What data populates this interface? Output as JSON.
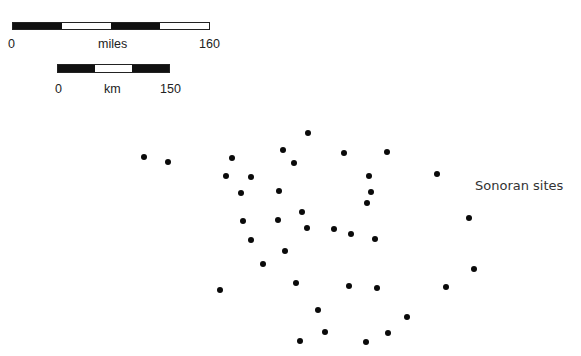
{
  "scale_bars": {
    "miles": {
      "start": "0",
      "unit": "miles",
      "end": "160",
      "segments": [
        "black",
        "white",
        "black",
        "white"
      ]
    },
    "km": {
      "start": "0",
      "unit": "km",
      "end": "150",
      "segments": [
        "black",
        "white",
        "black"
      ]
    }
  },
  "legend": {
    "label": "Sonoran sites",
    "marker_color": "#0a0a0a"
  },
  "sites": [
    {
      "x": 144,
      "y": 157
    },
    {
      "x": 168,
      "y": 162
    },
    {
      "x": 232,
      "y": 158
    },
    {
      "x": 308,
      "y": 133
    },
    {
      "x": 283,
      "y": 150
    },
    {
      "x": 294,
      "y": 163
    },
    {
      "x": 226,
      "y": 176
    },
    {
      "x": 251,
      "y": 177
    },
    {
      "x": 241,
      "y": 193
    },
    {
      "x": 279,
      "y": 191
    },
    {
      "x": 302,
      "y": 212
    },
    {
      "x": 344,
      "y": 153
    },
    {
      "x": 387,
      "y": 152
    },
    {
      "x": 369,
      "y": 176
    },
    {
      "x": 371,
      "y": 192
    },
    {
      "x": 367,
      "y": 203
    },
    {
      "x": 437,
      "y": 174
    },
    {
      "x": 469,
      "y": 218
    },
    {
      "x": 243,
      "y": 221
    },
    {
      "x": 278,
      "y": 220
    },
    {
      "x": 307,
      "y": 228
    },
    {
      "x": 334,
      "y": 229
    },
    {
      "x": 351,
      "y": 234
    },
    {
      "x": 375,
      "y": 239
    },
    {
      "x": 251,
      "y": 240
    },
    {
      "x": 285,
      "y": 251
    },
    {
      "x": 263,
      "y": 264
    },
    {
      "x": 220,
      "y": 290
    },
    {
      "x": 296,
      "y": 283
    },
    {
      "x": 349,
      "y": 286
    },
    {
      "x": 377,
      "y": 288
    },
    {
      "x": 318,
      "y": 310
    },
    {
      "x": 325,
      "y": 332
    },
    {
      "x": 388,
      "y": 333
    },
    {
      "x": 300,
      "y": 341
    },
    {
      "x": 366,
      "y": 342
    },
    {
      "x": 474,
      "y": 269
    },
    {
      "x": 446,
      "y": 287
    },
    {
      "x": 407,
      "y": 317
    }
  ]
}
